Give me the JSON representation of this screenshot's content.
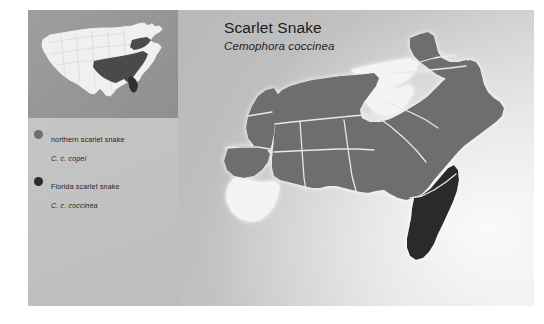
{
  "title": {
    "common_name": "Scarlet Snake",
    "scientific_name": "Cemophora coccinea"
  },
  "legend": {
    "items": [
      {
        "common_name": "northern scarlet snake",
        "scientific_name": "C. c. copei",
        "swatch_color": "#6e6e6e",
        "icon": "circle-swatch-icon"
      },
      {
        "common_name": "Florida scarlet snake",
        "scientific_name": "C. c. coccinea",
        "swatch_color": "#2b2b2b",
        "icon": "circle-swatch-icon"
      }
    ]
  },
  "colors": {
    "range_northern": "#6e6e6e",
    "range_florida": "#2b2b2b",
    "state_outline": "#f2f2f2",
    "unshaded_state": "#f0f0f0",
    "panel_left": "#c4c4c4",
    "panel_right": "#c8c8c8",
    "inset_panel": "#979797",
    "inset_country": "#f0f0f0",
    "page_background": "#ffffff"
  },
  "inset_map": {
    "name": "united-states-locator-map",
    "description": "Continental United States outline with southeastern range states highlighted"
  },
  "main_map": {
    "name": "southeastern-united-states-range-map",
    "description": "Range map of the scarlet snake across the southeastern United States",
    "shaded_states_northern": [
      "New Jersey",
      "Delaware",
      "Maryland",
      "Virginia",
      "North Carolina",
      "South Carolina",
      "Georgia",
      "Tennessee",
      "Kentucky",
      "Alabama",
      "Mississippi",
      "Louisiana",
      "Arkansas",
      "Missouri",
      "Oklahoma",
      "Texas",
      "Indiana"
    ],
    "shaded_states_florida": [
      "Florida"
    ],
    "unshaded_states": [
      "Pennsylvania",
      "Ohio",
      "West Virginia",
      "southern Louisiana"
    ]
  }
}
